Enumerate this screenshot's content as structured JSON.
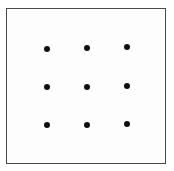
{
  "figure": {
    "name": "nine-dots-grid",
    "background_color": "#fdfdfd",
    "page_color": "#ffffff",
    "border": {
      "color": "#4a4a4a",
      "width_px": 1.5,
      "left_px": 6,
      "top_px": 8,
      "width_box_px": 160,
      "height_box_px": 156
    },
    "dot": {
      "color": "#101010",
      "diameter_px": 6,
      "count": 9,
      "rows": 3,
      "columns": 3
    },
    "positions": [
      {
        "label": "dot-row1-col1",
        "x": 47,
        "y": 49
      },
      {
        "label": "dot-row1-col2",
        "x": 87,
        "y": 48
      },
      {
        "label": "dot-row1-col3",
        "x": 127,
        "y": 47
      },
      {
        "label": "dot-row2-col1",
        "x": 47,
        "y": 87
      },
      {
        "label": "dot-row2-col2",
        "x": 87,
        "y": 87
      },
      {
        "label": "dot-row2-col3",
        "x": 127,
        "y": 86
      },
      {
        "label": "dot-row3-col1",
        "x": 47,
        "y": 125
      },
      {
        "label": "dot-row3-col2",
        "x": 87,
        "y": 125
      },
      {
        "label": "dot-row3-col3",
        "x": 127,
        "y": 124
      }
    ]
  }
}
